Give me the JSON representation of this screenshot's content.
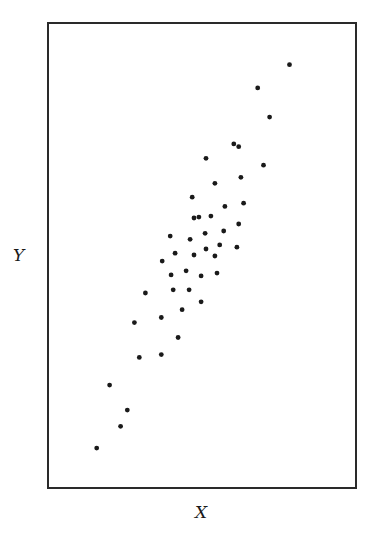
{
  "chart_data": {
    "type": "scatter",
    "title": "",
    "xlabel": "X",
    "ylabel": "Y",
    "grid": false,
    "legend": null,
    "xlim": [
      0,
      100
    ],
    "ylim": [
      0,
      100
    ],
    "note": "No tick labels shown; coordinates are normalized to the plot frame (0-100).",
    "points": [
      {
        "x": 78.6,
        "y": 91.2
      },
      {
        "x": 68.2,
        "y": 86.2
      },
      {
        "x": 72.1,
        "y": 79.9
      },
      {
        "x": 60.4,
        "y": 74.1
      },
      {
        "x": 62.0,
        "y": 73.5
      },
      {
        "x": 51.3,
        "y": 71.0
      },
      {
        "x": 70.1,
        "y": 69.5
      },
      {
        "x": 62.7,
        "y": 66.9
      },
      {
        "x": 54.2,
        "y": 65.6
      },
      {
        "x": 46.8,
        "y": 62.6
      },
      {
        "x": 57.5,
        "y": 60.6
      },
      {
        "x": 63.6,
        "y": 61.3
      },
      {
        "x": 47.4,
        "y": 58.1
      },
      {
        "x": 49.0,
        "y": 58.3
      },
      {
        "x": 52.9,
        "y": 58.5
      },
      {
        "x": 62.0,
        "y": 56.8
      },
      {
        "x": 39.6,
        "y": 54.2
      },
      {
        "x": 46.1,
        "y": 53.5
      },
      {
        "x": 51.0,
        "y": 54.8
      },
      {
        "x": 57.1,
        "y": 55.3
      },
      {
        "x": 51.3,
        "y": 51.4
      },
      {
        "x": 55.8,
        "y": 52.3
      },
      {
        "x": 61.4,
        "y": 51.8
      },
      {
        "x": 41.2,
        "y": 50.5
      },
      {
        "x": 47.4,
        "y": 50.1
      },
      {
        "x": 54.2,
        "y": 49.9
      },
      {
        "x": 37.0,
        "y": 48.8
      },
      {
        "x": 44.8,
        "y": 46.7
      },
      {
        "x": 39.9,
        "y": 45.8
      },
      {
        "x": 49.7,
        "y": 45.6
      },
      {
        "x": 54.9,
        "y": 46.2
      },
      {
        "x": 31.5,
        "y": 41.9
      },
      {
        "x": 40.6,
        "y": 42.6
      },
      {
        "x": 45.8,
        "y": 42.6
      },
      {
        "x": 49.7,
        "y": 40.0
      },
      {
        "x": 43.5,
        "y": 38.3
      },
      {
        "x": 36.7,
        "y": 36.6
      },
      {
        "x": 27.9,
        "y": 35.5
      },
      {
        "x": 42.2,
        "y": 32.3
      },
      {
        "x": 36.7,
        "y": 28.6
      },
      {
        "x": 29.5,
        "y": 28.0
      },
      {
        "x": 19.8,
        "y": 22.0
      },
      {
        "x": 25.6,
        "y": 16.6
      },
      {
        "x": 23.4,
        "y": 13.1
      },
      {
        "x": 15.6,
        "y": 8.4
      }
    ]
  },
  "labels": {
    "x_axis": "X",
    "y_axis": "Y"
  },
  "colors": {
    "points": "#1a1a1a",
    "frame": "#2a2a2a",
    "background": "#ffffff"
  }
}
